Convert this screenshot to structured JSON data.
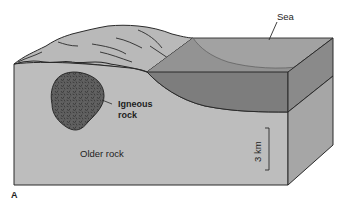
{
  "diagram": {
    "type": "geologic block diagram",
    "panel_label": "A",
    "labels": {
      "sea": "Sea",
      "igneous_line1": "Igneous",
      "igneous_line2": "rock",
      "older_rock": "Older rock",
      "scale": "3 km"
    },
    "colors": {
      "land_surface": "#b9b9b9",
      "front_face": "#bdbdbd",
      "sea_surface": "#a2a2a2",
      "sea_front": "#7d7d7d",
      "sea_shore_slope": "#8f8f8f",
      "right_face_water": "#8a8a8a",
      "right_face_rock": "#a6a6a6",
      "igneous": "#5e5e5e",
      "outline": "#2a2a2a"
    }
  }
}
